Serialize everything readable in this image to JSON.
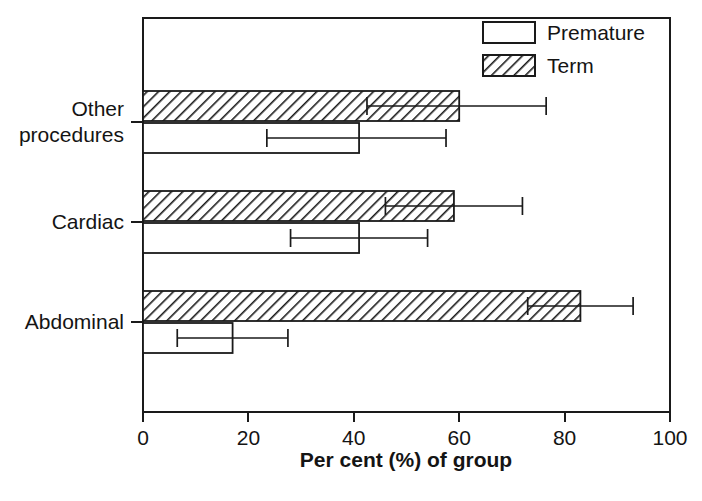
{
  "chart_data": {
    "type": "bar",
    "orientation": "horizontal",
    "title": "",
    "subtitle": "",
    "xlabel": "Per cent (%) of group",
    "ylabel": "",
    "xlim": [
      0,
      100
    ],
    "xticks": [
      0,
      20,
      40,
      60,
      80,
      100
    ],
    "xtick_labels": [
      "0",
      "20",
      "40",
      "60",
      "80",
      "100"
    ],
    "categories": [
      "Other procedures",
      "Cardiac",
      "Abdominal"
    ],
    "category_display": [
      [
        "Other",
        "procedures"
      ],
      [
        "Cardiac"
      ],
      [
        "Abdominal"
      ]
    ],
    "grid": false,
    "legend_position": "top-right",
    "series": [
      {
        "name": "Premature",
        "fill": "open",
        "values": [
          41.0,
          41.0,
          17.0
        ],
        "error_low": [
          23.5,
          28.0,
          6.5
        ],
        "error_high": [
          57.5,
          54.0,
          27.5
        ]
      },
      {
        "name": "Term",
        "fill": "hatched",
        "values": [
          60.0,
          59.0,
          83.0
        ],
        "error_low": [
          42.5,
          46.0,
          73.0
        ],
        "error_high": [
          76.5,
          72.0,
          93.0
        ]
      }
    ],
    "legend_entries": [
      {
        "label": "Premature",
        "swatch": "open-box"
      },
      {
        "label": "Term",
        "swatch": "hatched-box"
      }
    ],
    "colors": {
      "axis": "#1a1a1a",
      "bar_stroke": "#1a1a1a",
      "bar_open_fill": "#ffffff",
      "hatch_stroke": "#1a1a1a",
      "background": "#ffffff"
    }
  }
}
